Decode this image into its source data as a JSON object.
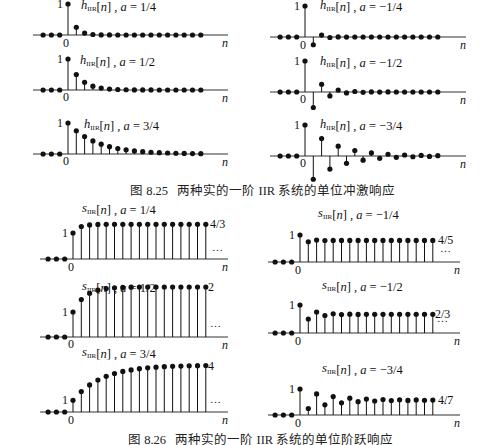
{
  "figures": [
    {
      "id": "fig-8-25",
      "caption": "图 8.25   两种实的一阶 IIR 系统的单位冲激响应",
      "caption_pos": {
        "x": 130,
        "y": 180
      },
      "type": "impulse"
    },
    {
      "id": "fig-8-26",
      "caption": "图 8.26   两种实的一阶 IIR 系统的单位阶跃响应",
      "caption_pos": {
        "x": 128,
        "y": 429
      },
      "type": "step"
    }
  ],
  "chart_data": [
    {
      "type": "scatter",
      "subtype": "stem",
      "title": "h_IIR[n], a = 1/4",
      "xlabel": "n",
      "signal": "h_IIR[n]",
      "a": 0.25,
      "n": [
        -3,
        -2,
        -1,
        0,
        1,
        2,
        3,
        4,
        5,
        6,
        7,
        8,
        9,
        10,
        11,
        12,
        13,
        14,
        15,
        16
      ],
      "values": [
        0,
        0,
        0,
        1,
        0.25,
        0.0625,
        0.0156,
        0.0039,
        0.001,
        0,
        0,
        0,
        0,
        0,
        0,
        0,
        0,
        0,
        0,
        0
      ],
      "ytick_labels": [
        "1"
      ],
      "xtick_labels": [
        "0"
      ]
    },
    {
      "type": "scatter",
      "subtype": "stem",
      "title": "h_IIR[n], a = 1/2",
      "xlabel": "n",
      "signal": "h_IIR[n]",
      "a": 0.5,
      "n": [
        -3,
        -2,
        -1,
        0,
        1,
        2,
        3,
        4,
        5,
        6,
        7,
        8,
        9,
        10,
        11,
        12,
        13,
        14,
        15,
        16
      ],
      "values": [
        0,
        0,
        0,
        1,
        0.5,
        0.25,
        0.125,
        0.0625,
        0.03125,
        0.0156,
        0.0078,
        0.0039,
        0.002,
        0.001,
        0,
        0,
        0,
        0,
        0,
        0
      ],
      "ytick_labels": [
        "1"
      ],
      "xtick_labels": [
        "0"
      ]
    },
    {
      "type": "scatter",
      "subtype": "stem",
      "title": "h_IIR[n], a = 3/4",
      "xlabel": "n",
      "signal": "h_IIR[n]",
      "a": 0.75,
      "n": [
        -3,
        -2,
        -1,
        0,
        1,
        2,
        3,
        4,
        5,
        6,
        7,
        8,
        9,
        10,
        11,
        12,
        13,
        14,
        15,
        16
      ],
      "values": [
        0,
        0,
        0,
        1,
        0.75,
        0.5625,
        0.4219,
        0.3164,
        0.2373,
        0.178,
        0.1335,
        0.1001,
        0.0751,
        0.0563,
        0.0422,
        0.0317,
        0.0238,
        0.0178,
        0.0134,
        0.01
      ],
      "ytick_labels": [
        "1"
      ],
      "xtick_labels": [
        "0"
      ]
    },
    {
      "type": "scatter",
      "subtype": "stem",
      "title": "h_IIR[n], a = −1/4",
      "xlabel": "n",
      "signal": "h_IIR[n]",
      "a": -0.25,
      "n": [
        -3,
        -2,
        -1,
        0,
        1,
        2,
        3,
        4,
        5,
        6,
        7,
        8,
        9,
        10,
        11,
        12,
        13,
        14,
        15,
        16
      ],
      "values": [
        0,
        0,
        0,
        1,
        -0.25,
        0.0625,
        -0.0156,
        0.0039,
        -0.001,
        0,
        0,
        0,
        0,
        0,
        0,
        0,
        0,
        0,
        0,
        0
      ],
      "ytick_labels": [
        "1"
      ],
      "xtick_labels": [
        "0"
      ]
    },
    {
      "type": "scatter",
      "subtype": "stem",
      "title": "h_IIR[n], a = −1/2",
      "xlabel": "n",
      "signal": "h_IIR[n]",
      "a": -0.5,
      "n": [
        -3,
        -2,
        -1,
        0,
        1,
        2,
        3,
        4,
        5,
        6,
        7,
        8,
        9,
        10,
        11,
        12,
        13,
        14,
        15,
        16
      ],
      "values": [
        0,
        0,
        0,
        1,
        -0.5,
        0.25,
        -0.125,
        0.0625,
        -0.03125,
        0.0156,
        -0.0078,
        0.0039,
        -0.002,
        0.001,
        0,
        0,
        0,
        0,
        0,
        0
      ],
      "ytick_labels": [
        "1"
      ],
      "xtick_labels": [
        "0"
      ]
    },
    {
      "type": "scatter",
      "subtype": "stem",
      "title": "h_IIR[n], a = −3/4",
      "xlabel": "n",
      "signal": "h_IIR[n]",
      "a": -0.75,
      "n": [
        -3,
        -2,
        -1,
        0,
        1,
        2,
        3,
        4,
        5,
        6,
        7,
        8,
        9,
        10,
        11,
        12,
        13,
        14,
        15,
        16
      ],
      "values": [
        0,
        0,
        0,
        1,
        -0.75,
        0.5625,
        -0.4219,
        0.3164,
        -0.2373,
        0.178,
        -0.1335,
        0.1001,
        -0.0751,
        0.0563,
        -0.0422,
        0.0317,
        -0.0238,
        0.0178,
        -0.0134,
        0.01
      ],
      "ytick_labels": [
        "1"
      ],
      "xtick_labels": [
        "0"
      ]
    },
    {
      "type": "scatter",
      "subtype": "stem",
      "title": "s_IIR[n], a = 1/4",
      "xlabel": "n",
      "signal": "s_IIR[n]",
      "a": 0.25,
      "n": [
        -3,
        -2,
        -1,
        0,
        1,
        2,
        3,
        4,
        5,
        6,
        7,
        8,
        9,
        10,
        11,
        12,
        13,
        14,
        15,
        16
      ],
      "values": [
        0,
        0,
        0,
        1,
        1.25,
        1.3125,
        1.3281,
        1.332,
        1.333,
        1.3333,
        1.3333,
        1.3333,
        1.3333,
        1.3333,
        1.3333,
        1.3333,
        1.3333,
        1.3333,
        1.3333,
        1.3333
      ],
      "ytick_labels": [
        "1"
      ],
      "xtick_labels": [
        "0"
      ],
      "annotations": [
        "4/3",
        "…"
      ]
    },
    {
      "type": "scatter",
      "subtype": "stem",
      "title": "s_IIR[n], a = 1/2",
      "xlabel": "n",
      "signal": "s_IIR[n]",
      "a": 0.5,
      "n": [
        -3,
        -2,
        -1,
        0,
        1,
        2,
        3,
        4,
        5,
        6,
        7,
        8,
        9,
        10,
        11,
        12,
        13,
        14,
        15,
        16
      ],
      "values": [
        0,
        0,
        0,
        1,
        1.5,
        1.75,
        1.875,
        1.9375,
        1.9688,
        1.9844,
        1.9922,
        1.9961,
        1.998,
        1.999,
        2,
        2,
        2,
        2,
        2,
        2
      ],
      "ytick_labels": [
        "1"
      ],
      "xtick_labels": [
        "0"
      ],
      "annotations": [
        "2",
        "…"
      ]
    },
    {
      "type": "scatter",
      "subtype": "stem",
      "title": "s_IIR[n], a = 3/4",
      "xlabel": "n",
      "signal": "s_IIR[n]",
      "a": 0.75,
      "n": [
        -3,
        -2,
        -1,
        0,
        1,
        2,
        3,
        4,
        5,
        6,
        7,
        8,
        9,
        10,
        11,
        12,
        13,
        14,
        15,
        16
      ],
      "values": [
        0,
        0,
        0,
        1,
        1.75,
        2.3125,
        2.7344,
        3.0508,
        3.2881,
        3.4661,
        3.5996,
        3.6997,
        3.7748,
        3.8311,
        3.8733,
        3.905,
        3.9288,
        3.9466,
        3.96,
        3.97
      ],
      "ytick_labels": [
        "1"
      ],
      "xtick_labels": [
        "0"
      ],
      "annotations": [
        "4",
        "…"
      ]
    },
    {
      "type": "scatter",
      "subtype": "stem",
      "title": "s_IIR[n], a = −1/4",
      "xlabel": "n",
      "signal": "s_IIR[n]",
      "a": -0.25,
      "n": [
        -3,
        -2,
        -1,
        0,
        1,
        2,
        3,
        4,
        5,
        6,
        7,
        8,
        9,
        10,
        11,
        12,
        13,
        14,
        15,
        16
      ],
      "values": [
        0,
        0,
        0,
        1,
        0.75,
        0.8125,
        0.7969,
        0.8008,
        0.7998,
        0.8,
        0.8,
        0.8,
        0.8,
        0.8,
        0.8,
        0.8,
        0.8,
        0.8,
        0.8,
        0.8
      ],
      "ytick_labels": [
        "1"
      ],
      "xtick_labels": [
        "0"
      ],
      "annotations": [
        "4/5",
        "…"
      ]
    },
    {
      "type": "scatter",
      "subtype": "stem",
      "title": "s_IIR[n], a = −1/2",
      "xlabel": "n",
      "signal": "s_IIR[n]",
      "a": -0.5,
      "n": [
        -3,
        -2,
        -1,
        0,
        1,
        2,
        3,
        4,
        5,
        6,
        7,
        8,
        9,
        10,
        11,
        12,
        13,
        14,
        15,
        16
      ],
      "values": [
        0,
        0,
        0,
        1,
        0.5,
        0.75,
        0.625,
        0.6875,
        0.6563,
        0.6719,
        0.6641,
        0.668,
        0.666,
        0.667,
        0.6667,
        0.6667,
        0.6667,
        0.6667,
        0.6667,
        0.6667
      ],
      "ytick_labels": [
        "1"
      ],
      "xtick_labels": [
        "0"
      ],
      "annotations": [
        "2/3",
        "…"
      ]
    },
    {
      "type": "scatter",
      "subtype": "stem",
      "title": "s_IIR[n], a = −3/4",
      "xlabel": "n",
      "signal": "s_IIR[n]",
      "a": -0.75,
      "n": [
        -3,
        -2,
        -1,
        0,
        1,
        2,
        3,
        4,
        5,
        6,
        7,
        8,
        9,
        10,
        11,
        12,
        13,
        14,
        15,
        16
      ],
      "values": [
        0,
        0,
        0,
        1,
        0.25,
        0.8125,
        0.3906,
        0.707,
        0.4697,
        0.6478,
        0.5142,
        0.6143,
        0.5392,
        0.5955,
        0.5533,
        0.5849,
        0.5612,
        0.579,
        0.5656,
        0.5757
      ],
      "ytick_labels": [
        "1"
      ],
      "xtick_labels": [
        "0"
      ],
      "annotations": [
        "4/7",
        "…"
      ]
    }
  ],
  "layout": {
    "panels": [
      {
        "x0": 68,
        "y0": 35,
        "scale": 31,
        "label_dx": 13,
        "label_y": 9,
        "tick_y": 47,
        "xn": 225,
        "ax_l": 33,
        "ax_r": 228,
        "ann_y": null,
        "dots_y": null
      },
      {
        "x0": 68,
        "y0": 90,
        "scale": 31,
        "label_dx": 12,
        "label_y": 64,
        "tick_y": 101,
        "xn": 225,
        "ax_l": 33,
        "ax_r": 228
      },
      {
        "x0": 68,
        "y0": 154,
        "scale": 31,
        "label_dx": 16,
        "label_y": 128,
        "tick_y": 165,
        "xn": 225,
        "ax_l": 33,
        "ax_r": 228
      },
      {
        "x0": 305,
        "y0": 37,
        "scale": 31,
        "label_dx": 15,
        "label_y": 9,
        "tick_y": 49,
        "xn": 463,
        "ax_l": 270,
        "ax_r": 466
      },
      {
        "x0": 305,
        "y0": 92,
        "scale": 31,
        "label_dx": 15,
        "label_y": 65,
        "tick_y": 103,
        "xn": 463,
        "ax_l": 270,
        "ax_r": 466
      },
      {
        "x0": 305,
        "y0": 156,
        "scale": 31,
        "label_dx": 15,
        "label_y": 128,
        "tick_y": 167,
        "xn": 463,
        "ax_l": 270,
        "ax_r": 466
      },
      {
        "x0": 73,
        "y0": 259,
        "scale": 26,
        "label_x": 82,
        "label_y": 212,
        "tick_y": 271,
        "xn": 225,
        "ax_l": 40,
        "ax_r": 228,
        "ann_x": 210,
        "dots_y": 251
      },
      {
        "x0": 73,
        "y0": 337,
        "scale": 25,
        "label_x": 82,
        "label_y": 290,
        "tick_y": 348,
        "xn": 225,
        "ax_l": 40,
        "ax_r": 228,
        "ann_x": 208,
        "dots_y": 327
      },
      {
        "x0": 73,
        "y0": 412,
        "scale": 11.7,
        "label_x": 82,
        "label_y": 356,
        "tick_y": 424,
        "xn": 225,
        "ax_l": 40,
        "ax_r": 228,
        "ann_x": 208,
        "dots_y": 403
      },
      {
        "x0": 300,
        "y0": 262,
        "scale": 27,
        "label_x": 318,
        "label_y": 217,
        "tick_y": 274,
        "xn": 457,
        "ax_l": 268,
        "ax_r": 460,
        "ann_x": 438,
        "dots_y": 252
      },
      {
        "x0": 300,
        "y0": 333,
        "scale": 28,
        "label_x": 322,
        "label_y": 289,
        "tick_y": 345,
        "xn": 457,
        "ax_l": 268,
        "ax_r": 460,
        "ann_x": 435,
        "dots_y": 322
      },
      {
        "x0": 300,
        "y0": 415,
        "scale": 26,
        "label_x": 322,
        "label_y": 372,
        "tick_y": 427,
        "xn": 457,
        "ax_l": 268,
        "ax_r": 460,
        "ann_x": 438,
        "dots_y": 404
      }
    ],
    "dx": 8.3,
    "ink": "#111111",
    "axis": "#333333"
  }
}
